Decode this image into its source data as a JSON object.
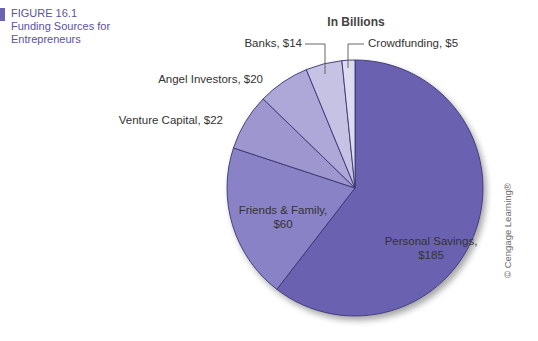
{
  "figure": {
    "number": "FIGURE 16.1",
    "title": "Funding Sources for Entrepreneurs",
    "mark_color": "#6b62b0"
  },
  "copyright": "© Cengage Learning®",
  "chart_data": {
    "type": "pie",
    "title": "In Billions",
    "unit": "billions USD",
    "categories": [
      "Personal Savings",
      "Friends & Family",
      "Venture Capital",
      "Angel Investors",
      "Banks",
      "Crowdfunding"
    ],
    "values": [
      185,
      60,
      22,
      20,
      14,
      5
    ],
    "labels": [
      "Personal Savings, $185",
      "Friends & Family, $60",
      "Venture Capital, $22",
      "Angel Investors, $20",
      "Banks, $14",
      "Crowdfunding, $5"
    ],
    "colors": [
      "#6b62b0",
      "#8a82c6",
      "#9d96cf",
      "#aea8d9",
      "#c6c2e4",
      "#dddbef"
    ],
    "start_angle_deg": 0,
    "direction": "clockwise",
    "legend": "none (direct labels)"
  }
}
